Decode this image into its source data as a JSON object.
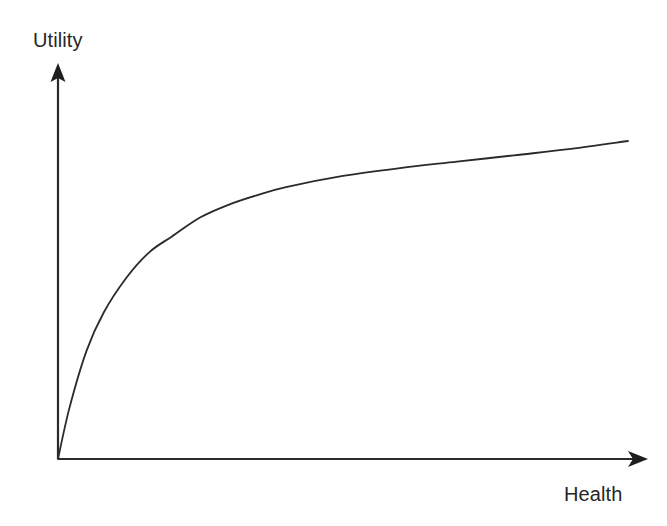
{
  "figure": {
    "background_color": "#ffffff",
    "line_color": "#2a2a2a",
    "text_color": "#262626"
  },
  "labels": {
    "y_axis": "Utility",
    "x_axis": "Health"
  },
  "chart_data": {
    "type": "line",
    "title": "",
    "xlabel": "Health",
    "ylabel": "Utility",
    "x": [
      0,
      0.02,
      0.05,
      0.08,
      0.12,
      0.16,
      0.2,
      0.25,
      0.3,
      0.35,
      0.4,
      0.5,
      0.6,
      0.7,
      0.8,
      0.9,
      1.0
    ],
    "values": [
      0,
      0.16,
      0.34,
      0.46,
      0.57,
      0.65,
      0.7,
      0.76,
      0.8,
      0.83,
      0.855,
      0.89,
      0.915,
      0.935,
      0.955,
      0.975,
      1.0
    ],
    "series": [
      {
        "name": "Utility of health",
        "values": [
          0,
          0.16,
          0.34,
          0.46,
          0.57,
          0.65,
          0.7,
          0.76,
          0.8,
          0.83,
          0.855,
          0.89,
          0.915,
          0.935,
          0.955,
          0.975,
          1.0
        ]
      }
    ],
    "xlim": [
      0,
      1
    ],
    "ylim": [
      0,
      1
    ],
    "grid": false,
    "legend": false,
    "legend_position": "none",
    "xticks": [],
    "yticks": [],
    "annotations": []
  },
  "geometry": {
    "origin_x": 58,
    "origin_y": 459,
    "y_axis_tip_y": 64,
    "x_axis_tip_x": 648,
    "curve_end_x": 628,
    "curve_end_y": 141,
    "stroke_width": 1.8
  }
}
